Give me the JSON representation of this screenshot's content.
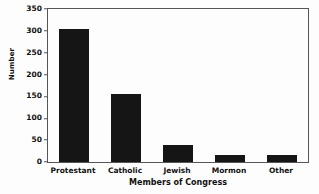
{
  "chart_data": {
    "type": "bar",
    "title": "",
    "xlabel": "Members of Congress",
    "ylabel": "Number",
    "categories": [
      "Protestant",
      "Catholic",
      "Jewish",
      "Mormon",
      "Other"
    ],
    "values": [
      304,
      156,
      39,
      15,
      16
    ],
    "ylim": [
      0,
      350
    ],
    "yticks": [
      0,
      50,
      100,
      150,
      200,
      250,
      300,
      350
    ],
    "ytick_labels": [
      "0",
      "50",
      "100",
      "150",
      "200",
      "250",
      "300",
      "350"
    ],
    "grid": false,
    "legend": null,
    "bar_color": "#151515",
    "axis_color": "#55565a",
    "background_color": "#fdfdfd"
  }
}
